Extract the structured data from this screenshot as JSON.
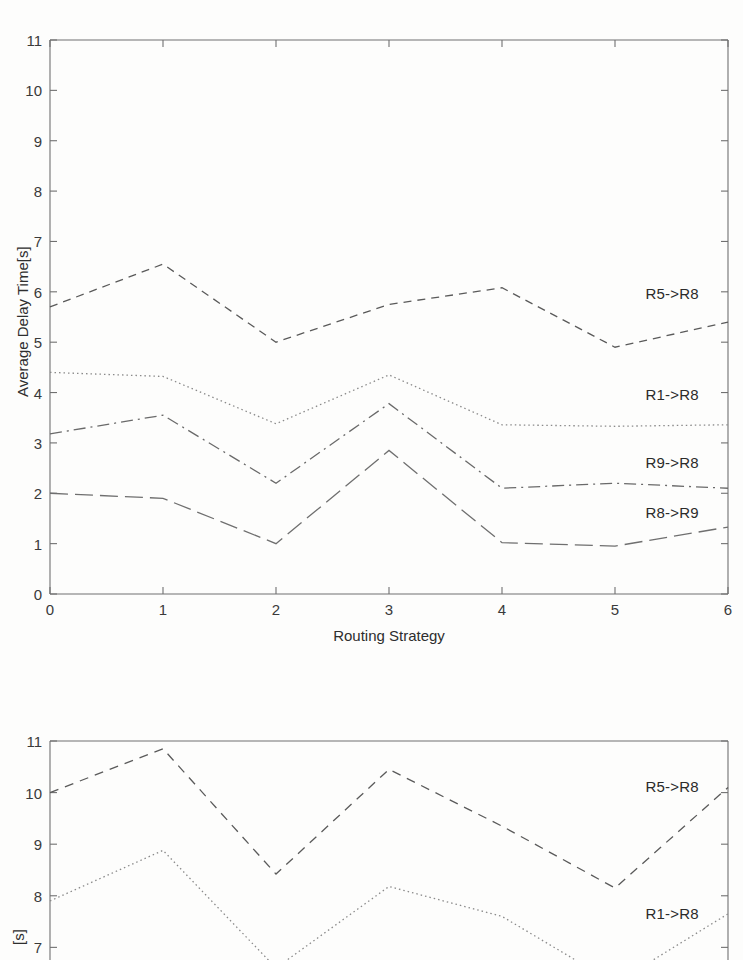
{
  "page": {
    "background_color": "#fdfdfc",
    "ink_color": "#555555",
    "text_color": "#2a2a2a"
  },
  "chart_data": [
    {
      "id": "top",
      "type": "line",
      "title": "",
      "subtitle": "",
      "xlabel": "Routing Strategy",
      "ylabel": "Average Delay Time[s]",
      "x": [
        0,
        1,
        2,
        3,
        4,
        5,
        6
      ],
      "xlim": [
        0,
        6
      ],
      "ylim": [
        0,
        11
      ],
      "xticks": [
        "0",
        "1",
        "2",
        "3",
        "4",
        "5",
        "6"
      ],
      "yticks": [
        "0",
        "1",
        "2",
        "3",
        "4",
        "5",
        "6",
        "7",
        "8",
        "9",
        "10",
        "11"
      ],
      "grid": false,
      "legend_position": "inline-right",
      "series": [
        {
          "name": "R5->R8",
          "values": [
            5.7,
            6.55,
            5.0,
            5.75,
            6.08,
            4.9,
            5.4
          ],
          "dash": "8,6",
          "color": "#5a5a5a",
          "label_x": 5.27,
          "label_y": 5.95
        },
        {
          "name": "R1->R8",
          "values": [
            4.4,
            4.32,
            3.38,
            4.35,
            3.36,
            3.33,
            3.36
          ],
          "dash": "1.5,3",
          "color": "#8a8a8a",
          "label_x": 5.27,
          "label_y": 3.96
        },
        {
          "name": "R9->R8",
          "values": [
            3.18,
            3.55,
            2.2,
            3.78,
            2.1,
            2.2,
            2.1
          ],
          "dash": "12,5,2,5",
          "color": "#6a6a6a",
          "label_x": 5.27,
          "label_y": 2.6
        },
        {
          "name": "R8->R9",
          "values": [
            2.0,
            1.9,
            1.0,
            2.85,
            1.02,
            0.95,
            1.33
          ],
          "dash": "18,7",
          "color": "#6f6f6f",
          "label_x": 5.27,
          "label_y": 1.6
        }
      ]
    },
    {
      "id": "bottom",
      "type": "line",
      "note": "cropped at bottom of page",
      "title": "",
      "xlabel": "",
      "ylabel": "[s]",
      "x": [
        0,
        1,
        2,
        3,
        4,
        5,
        6
      ],
      "xlim": [
        0,
        6
      ],
      "ylim": [
        6.6,
        11
      ],
      "yticks": [
        "7",
        "8",
        "9",
        "10",
        "11"
      ],
      "grid": false,
      "legend_position": "inline-right",
      "series": [
        {
          "name": "R5->R8",
          "values": [
            10.0,
            10.85,
            8.42,
            10.45,
            9.35,
            8.15,
            10.1
          ],
          "dash": "9,7",
          "color": "#5a5a5a",
          "label_x": 5.27,
          "label_y": 10.1
        },
        {
          "name": "R1->R8",
          "values": [
            7.9,
            8.88,
            6.6,
            8.18,
            7.6,
            6.3,
            7.65
          ],
          "dash": "1.5,3",
          "color": "#8a8a8a",
          "label_x": 5.27,
          "label_y": 7.65
        }
      ]
    }
  ]
}
